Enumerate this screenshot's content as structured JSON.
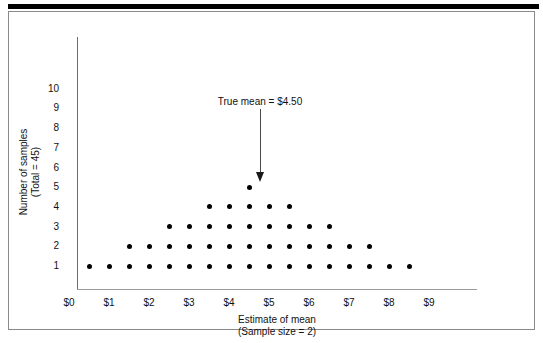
{
  "figure": {
    "background_color": "#ffffff",
    "frame_color": "#8a8a8a",
    "rule_color": "#000000",
    "dot_color": "#000000"
  },
  "annotation": {
    "text": "True mean  =  $4.50",
    "points_to_x": "$4.50"
  },
  "axes": {
    "y_title_line1": "Number of samples",
    "y_title_line2": "(Total = 45)",
    "x_title_line1": "Estimate of mean",
    "x_title_line2": "(Sample size = 2)",
    "y_ticks": [
      "1",
      "2",
      "3",
      "4",
      "5",
      "6",
      "7",
      "8",
      "9",
      "10"
    ],
    "x_ticks": [
      "$0",
      "$1",
      "$2",
      "$3",
      "$4",
      "$5",
      "$6",
      "$7",
      "$8",
      "$9"
    ]
  },
  "chart_data": {
    "type": "scatter",
    "title": "",
    "subtitle": "",
    "xlabel": "Estimate of mean (Sample size = 2)",
    "ylabel": "Number of samples (Total = 45)",
    "xlim": [
      0,
      10
    ],
    "ylim": [
      0,
      10.5
    ],
    "grid": false,
    "legend": "none",
    "annotations": [
      {
        "text": "True mean  =  $4.50",
        "x": 4.5,
        "y": 9.3,
        "arrow_to": [
          4.5,
          5.55
        ]
      }
    ],
    "x_tick_values": [
      0,
      1,
      2,
      3,
      4,
      5,
      6,
      7,
      8,
      9
    ],
    "x_tick_labels": [
      "$0",
      "$1",
      "$2",
      "$3",
      "$4",
      "$5",
      "$6",
      "$7",
      "$8",
      "$9"
    ],
    "y_tick_values": [
      1,
      2,
      3,
      4,
      5,
      6,
      7,
      8,
      9,
      10
    ],
    "y_tick_labels": [
      "1",
      "2",
      "3",
      "4",
      "5",
      "6",
      "7",
      "8",
      "9",
      "10"
    ],
    "total_samples": 45,
    "bin_width": 0.5,
    "bins": [
      {
        "x": 0.5,
        "count": 1
      },
      {
        "x": 1.0,
        "count": 1
      },
      {
        "x": 1.5,
        "count": 2
      },
      {
        "x": 2.0,
        "count": 2
      },
      {
        "x": 2.5,
        "count": 3
      },
      {
        "x": 3.0,
        "count": 3
      },
      {
        "x": 3.5,
        "count": 4
      },
      {
        "x": 4.0,
        "count": 4
      },
      {
        "x": 4.5,
        "count": 5
      },
      {
        "x": 5.0,
        "count": 4
      },
      {
        "x": 5.5,
        "count": 4
      },
      {
        "x": 6.0,
        "count": 3
      },
      {
        "x": 6.5,
        "count": 3
      },
      {
        "x": 7.0,
        "count": 2
      },
      {
        "x": 7.5,
        "count": 2
      },
      {
        "x": 8.0,
        "count": 1
      },
      {
        "x": 8.5,
        "count": 1
      }
    ],
    "rows": [
      {
        "level": 1,
        "x_start": 0.5,
        "x_end": 8.5,
        "n": 17
      },
      {
        "level": 2,
        "x_start": 1.5,
        "x_end": 7.5,
        "n": 13
      },
      {
        "level": 3,
        "x_start": 2.5,
        "x_end": 6.5,
        "n": 9
      },
      {
        "level": 4,
        "x_start": 3.5,
        "x_end": 5.5,
        "n": 5
      },
      {
        "level": 5,
        "x_start": 4.5,
        "x_end": 4.5,
        "n": 1
      }
    ]
  }
}
